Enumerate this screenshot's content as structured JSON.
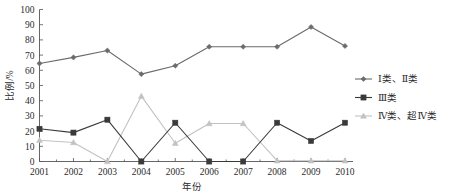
{
  "chart_data": {
    "type": "line",
    "title": "",
    "xlabel": "年份",
    "ylabel": "比例/%",
    "categories": [
      "2001",
      "2002",
      "2003",
      "2004",
      "2005",
      "2006",
      "2007",
      "2008",
      "2009",
      "2010"
    ],
    "xlim": [
      2001,
      2010
    ],
    "ylim": [
      0,
      100
    ],
    "yticks": [
      0,
      10,
      20,
      30,
      40,
      50,
      60,
      70,
      80,
      90,
      100
    ],
    "grid": false,
    "legend_position": "right",
    "series": [
      {
        "name": "Ⅰ类、Ⅱ类",
        "marker": "diamond",
        "color": "#6b6b6b",
        "values": [
          64.5,
          68.5,
          73.0,
          57.5,
          63.0,
          75.5,
          75.5,
          75.5,
          88.5,
          76.0
        ]
      },
      {
        "name": "Ⅲ类",
        "marker": "square",
        "color": "#3a3a3a",
        "values": [
          21.5,
          19.0,
          27.5,
          0.0,
          25.5,
          0.0,
          0.0,
          25.5,
          13.5,
          25.5
        ]
      },
      {
        "name": "Ⅳ类、超Ⅳ类",
        "marker": "triangle",
        "color": "#c2c2c2",
        "values": [
          14.0,
          12.5,
          0.0,
          43.0,
          12.0,
          25.0,
          25.0,
          0.5,
          0.5,
          0.5
        ]
      }
    ]
  },
  "axes": {
    "y_title": "比例/%",
    "x_title": "年份",
    "y_tick_labels": [
      "0",
      "10",
      "20",
      "30",
      "40",
      "50",
      "60",
      "70",
      "80",
      "90",
      "100"
    ],
    "x_tick_labels": [
      "2001",
      "2002",
      "2003",
      "2004",
      "2005",
      "2006",
      "2007",
      "2008",
      "2009",
      "2010"
    ]
  },
  "legend": {
    "items": [
      {
        "label": "Ⅰ类、Ⅱ类",
        "color": "#6b6b6b",
        "marker": "diamond"
      },
      {
        "label": "Ⅲ类",
        "color": "#3a3a3a",
        "marker": "square"
      },
      {
        "label": "Ⅳ类、超Ⅳ类",
        "color": "#c2c2c2",
        "marker": "triangle"
      }
    ]
  }
}
